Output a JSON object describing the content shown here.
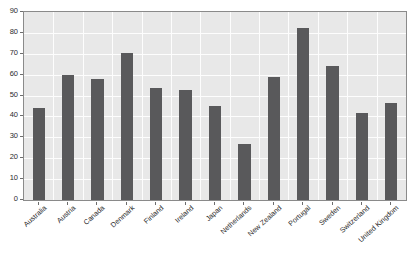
{
  "chart_data": {
    "type": "bar",
    "title": "",
    "xlabel": "",
    "ylabel": "",
    "ylim": [
      0,
      90
    ],
    "ytick_step": 10,
    "yticks": [
      "90",
      "80",
      "70",
      "60",
      "50",
      "40",
      "30",
      "20",
      "10",
      "0"
    ],
    "grid": true,
    "legend": "none",
    "categories": [
      "Australia",
      "Austria",
      "Canada",
      "Denmark",
      "Finland",
      "Ireland",
      "Japan",
      "Netherlands",
      "New Zealand",
      "Portugal",
      "Sweden",
      "Switzerland",
      "United Kingdom"
    ],
    "values": [
      44,
      60,
      58,
      70.5,
      53.5,
      52.5,
      45,
      27,
      59,
      82.5,
      64,
      41.5,
      46.5
    ]
  },
  "style": {
    "bar_color": "#59595b",
    "plot_background": "#e8e8e8",
    "gridline_color": "#fdfdfd",
    "axis_color": "#8a8a8a",
    "text_color": "#2b2b2b",
    "page_background": "#ffffff"
  }
}
